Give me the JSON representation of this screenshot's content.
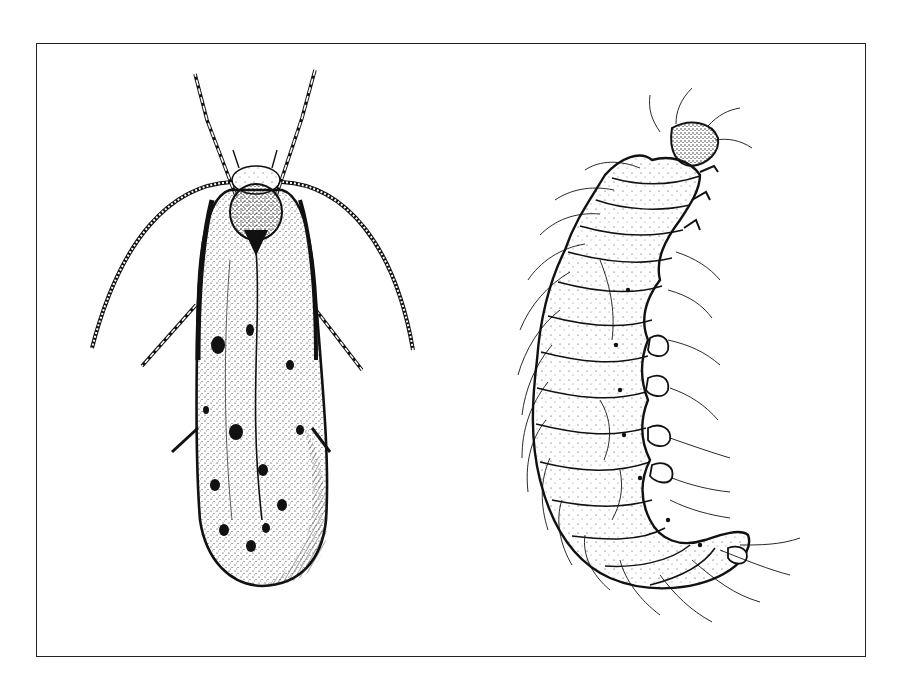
{
  "figure": {
    "type": "scientific-illustration",
    "style": "black-and-white stipple pen drawing",
    "colors": {
      "ink": "#111111",
      "paper": "#ffffff",
      "frame": "#222222"
    },
    "panels": [
      {
        "id": "adult-moth",
        "subject": "adult moth, dorsal view, wings folded",
        "position": "left"
      },
      {
        "id": "larva",
        "subject": "larva (caterpillar), lateral curved view",
        "position": "right"
      }
    ]
  }
}
